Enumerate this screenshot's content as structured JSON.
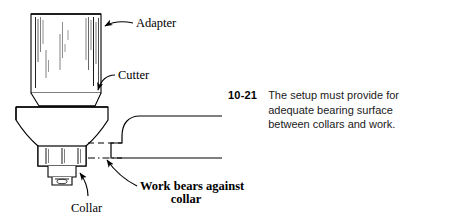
{
  "figure": {
    "number": "10-21",
    "caption_lines": [
      "The setup must provide for",
      "adequate bearing surface",
      "between collars and work."
    ],
    "labels": {
      "adapter": "Adapter",
      "cutter": "Cutter",
      "collar": "Collar",
      "work_bears_line1": "Work bears against",
      "work_bears_line2": "collar"
    },
    "colors": {
      "ink": "#000000",
      "paper": "#ffffff",
      "caption_text": "#1a1a1a"
    }
  }
}
